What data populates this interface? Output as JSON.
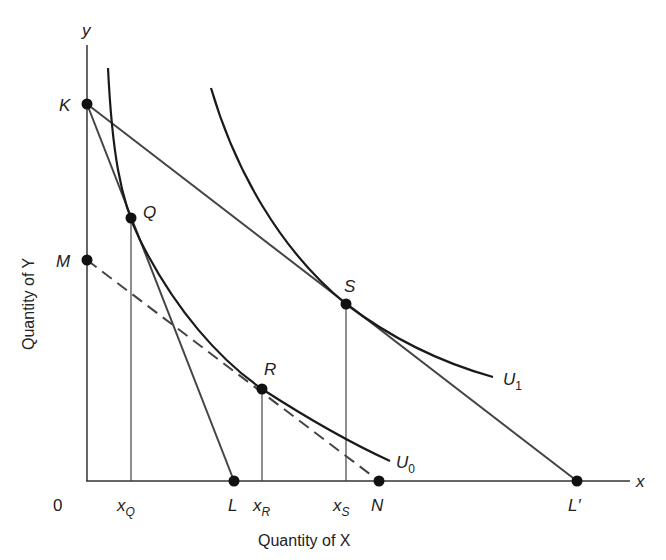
{
  "diagram": {
    "type": "indifference-curve-budget-lines",
    "axes": {
      "x_axis_letter": "x",
      "y_axis_letter": "y",
      "x_title": "Quantity of X",
      "y_title": "Quantity of Y",
      "origin_label": "0"
    },
    "points": {
      "K": "K",
      "M": "M",
      "Q": "Q",
      "R": "R",
      "S": "S",
      "L": "L",
      "N": "N",
      "Lprime": "L′"
    },
    "x_markers": {
      "xQ_base": "x",
      "xQ_sub": "Q",
      "xR_base": "x",
      "xR_sub": "R",
      "xS_base": "x",
      "xS_sub": "S"
    },
    "curves": {
      "U0_base": "U",
      "U0_sub": "0",
      "U1_base": "U",
      "U1_sub": "1"
    },
    "lines": [
      {
        "name": "budget-KL",
        "from": "K",
        "to": "L",
        "style": "solid"
      },
      {
        "name": "budget-KL'",
        "from": "K",
        "to": "L′",
        "style": "solid"
      },
      {
        "name": "compensated-MN",
        "from": "M",
        "to": "N",
        "style": "dashed"
      }
    ],
    "colors": {
      "ink": "#222222",
      "line": "#444444",
      "background": "#ffffff"
    }
  }
}
